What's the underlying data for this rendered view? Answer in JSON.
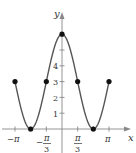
{
  "chart_data": {
    "type": "line",
    "title": "",
    "xlabel": "x",
    "ylabel": "y",
    "function": "y = 3 + 3cos(3x/2)",
    "xlim": [
      -3.5,
      3.7
    ],
    "ylim": [
      0,
      6.4
    ],
    "grid": false,
    "legend": null,
    "x_tick_labels": [
      "-π",
      "-π/3",
      "π/3",
      "π"
    ],
    "x_ticks": [
      -3.1416,
      -2.0944,
      -1.0472,
      1.0472,
      2.0944,
      3.1416
    ],
    "y_tick_labels": [
      "1",
      "2",
      "3",
      "4"
    ],
    "y_ticks": [
      1,
      2,
      3,
      4,
      5
    ],
    "marked_points": [
      {
        "x": -3.1416,
        "y": 3
      },
      {
        "x": -2.0944,
        "y": 0
      },
      {
        "x": -1.0472,
        "y": 3
      },
      {
        "x": 0,
        "y": 6
      },
      {
        "x": 1.0472,
        "y": 3
      },
      {
        "x": 2.0944,
        "y": 0
      },
      {
        "x": 3.1416,
        "y": 3
      }
    ],
    "series": [
      {
        "name": "curve",
        "color": "#555555"
      }
    ]
  },
  "labels": {
    "y_axis": "y",
    "x_axis": "x",
    "neg_pi": "−π",
    "neg_pi3_num": "π",
    "neg_pi3_den": "3",
    "neg_sign": "−",
    "pi3_num": "π",
    "pi3_den": "3",
    "pi": "π",
    "y1": "1",
    "y2": "2",
    "y3": "3",
    "y4": "4"
  }
}
